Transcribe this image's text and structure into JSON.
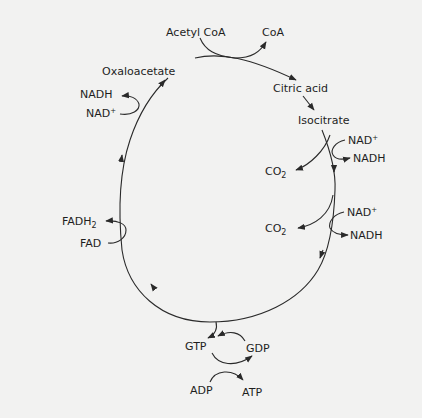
{
  "diagram": {
    "cycle_nodes": [
      {
        "id": "oxaloacetate",
        "label": "Oxaloacetate"
      },
      {
        "id": "citric-acid",
        "label": "Citric acid"
      },
      {
        "id": "isocitrate",
        "label": "Isocitrate"
      }
    ],
    "inputs_outputs": {
      "acetyl_coa": "Acetyl CoA",
      "coa": "CoA",
      "nad_plus_1": {
        "base": "NAD",
        "sup": "+"
      },
      "nadh_1": "NADH",
      "co2_1": {
        "base": "CO",
        "sub": "2"
      },
      "nad_plus_2": {
        "base": "NAD",
        "sup": "+"
      },
      "nadh_2": "NADH",
      "co2_2": {
        "base": "CO",
        "sub": "2"
      },
      "gtp": "GTP",
      "gdp": "GDP",
      "adp": "ADP",
      "atp": "ATP",
      "fadh2": {
        "base": "FADH",
        "sub": "2"
      },
      "fad": "FAD",
      "nadh_3": "NADH",
      "nad_plus_3": {
        "base": "NAD",
        "sup": "+"
      }
    },
    "colors": {
      "line": "#2a2a2a",
      "text": "#1e1e1e",
      "background": "#f2f2f1"
    }
  }
}
